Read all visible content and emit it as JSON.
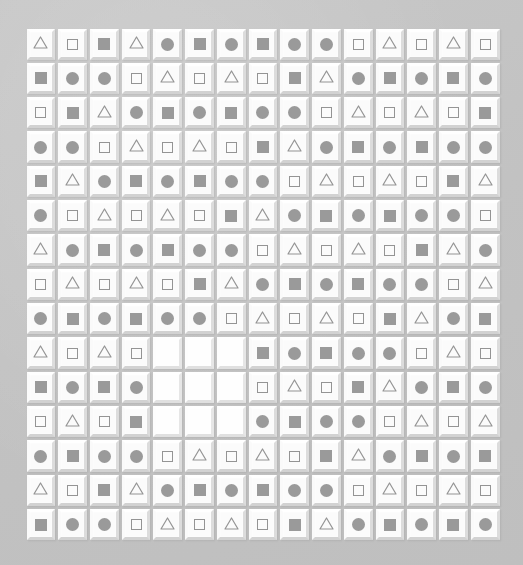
{
  "canvas": {
    "width": 523,
    "height": 565,
    "background_color": "#c4c4c4",
    "description": "Beveled white tile grid with gray geometric glyphs"
  },
  "grid": {
    "rows": 15,
    "columns": 15,
    "cell_size_px": 31.7,
    "origin_x": 25,
    "origin_y": 27,
    "tile_color": "#fbfbfb",
    "tile_highlight_color": "#ffffff",
    "tile_shadow_color": "#d2d2d2",
    "glyph_color": "#9a9a9a",
    "glyph_outline_color": "#949494",
    "blank_tile_color": "#fefefe"
  },
  "legend": {
    "triangle": "triangle-outline",
    "square_outline": "square-outline",
    "square_filled": "square-filled",
    "circle": "circle-filled",
    "blank": "empty-tile"
  },
  "missing_region": {
    "row_start": 10,
    "row_end": 12,
    "column_start": 5,
    "column_end": 7,
    "count": 9,
    "label": "blank-3x3-block"
  },
  "cells": [
    [
      "triangle",
      "square_outline",
      "square_filled",
      "triangle",
      "circle",
      "square_filled",
      "circle",
      "square_filled",
      "circle",
      "circle",
      "square_outline",
      "triangle",
      "square_outline",
      "triangle",
      "square_outline"
    ],
    [
      "square_filled",
      "circle",
      "circle",
      "square_outline",
      "triangle",
      "square_outline",
      "triangle",
      "square_outline",
      "square_filled",
      "triangle",
      "circle",
      "square_filled",
      "circle",
      "square_filled",
      "circle"
    ],
    [
      "square_outline",
      "square_filled",
      "triangle",
      "circle",
      "square_filled",
      "circle",
      "square_filled",
      "circle",
      "circle",
      "square_outline",
      "triangle",
      "square_outline",
      "triangle",
      "square_outline",
      "square_filled"
    ],
    [
      "circle",
      "circle",
      "square_outline",
      "triangle",
      "square_outline",
      "triangle",
      "square_outline",
      "square_filled",
      "triangle",
      "circle",
      "square_filled",
      "circle",
      "square_filled",
      "circle",
      "circle"
    ],
    [
      "square_filled",
      "triangle",
      "circle",
      "square_filled",
      "circle",
      "square_filled",
      "circle",
      "circle",
      "square_outline",
      "triangle",
      "square_outline",
      "triangle",
      "square_outline",
      "square_filled",
      "triangle"
    ],
    [
      "circle",
      "square_outline",
      "triangle",
      "square_outline",
      "triangle",
      "square_outline",
      "square_filled",
      "triangle",
      "circle",
      "square_filled",
      "circle",
      "square_filled",
      "circle",
      "circle",
      "square_outline"
    ],
    [
      "triangle",
      "circle",
      "square_filled",
      "circle",
      "square_filled",
      "circle",
      "circle",
      "square_outline",
      "triangle",
      "square_outline",
      "triangle",
      "square_outline",
      "square_filled",
      "triangle",
      "circle"
    ],
    [
      "square_outline",
      "triangle",
      "square_outline",
      "triangle",
      "square_outline",
      "square_filled",
      "triangle",
      "circle",
      "square_filled",
      "circle",
      "square_filled",
      "circle",
      "circle",
      "square_outline",
      "triangle"
    ],
    [
      "circle",
      "square_filled",
      "circle",
      "square_filled",
      "circle",
      "circle",
      "square_outline",
      "triangle",
      "square_outline",
      "triangle",
      "square_outline",
      "square_filled",
      "triangle",
      "circle",
      "square_filled"
    ],
    [
      "triangle",
      "square_outline",
      "triangle",
      "square_outline",
      "blank",
      "blank",
      "blank",
      "square_filled",
      "circle",
      "square_filled",
      "circle",
      "circle",
      "square_outline",
      "triangle",
      "square_outline"
    ],
    [
      "square_filled",
      "circle",
      "square_filled",
      "circle",
      "blank",
      "blank",
      "blank",
      "square_outline",
      "triangle",
      "square_outline",
      "square_filled",
      "triangle",
      "circle",
      "square_filled",
      "circle"
    ],
    [
      "square_outline",
      "triangle",
      "square_outline",
      "square_filled",
      "blank",
      "blank",
      "blank",
      "circle",
      "square_filled",
      "circle",
      "circle",
      "square_outline",
      "triangle",
      "square_outline",
      "triangle"
    ],
    [
      "circle",
      "square_filled",
      "circle",
      "circle",
      "square_outline",
      "triangle",
      "square_outline",
      "triangle",
      "square_outline",
      "square_filled",
      "triangle",
      "circle",
      "square_filled",
      "circle",
      "square_filled"
    ],
    [
      "triangle",
      "square_outline",
      "square_filled",
      "triangle",
      "circle",
      "square_filled",
      "circle",
      "square_filled",
      "circle",
      "circle",
      "square_outline",
      "triangle",
      "square_outline",
      "triangle",
      "square_outline"
    ],
    [
      "square_filled",
      "circle",
      "circle",
      "square_outline",
      "triangle",
      "square_outline",
      "triangle",
      "square_outline",
      "square_filled",
      "triangle",
      "circle",
      "square_filled",
      "circle",
      "square_filled",
      "circle"
    ]
  ]
}
